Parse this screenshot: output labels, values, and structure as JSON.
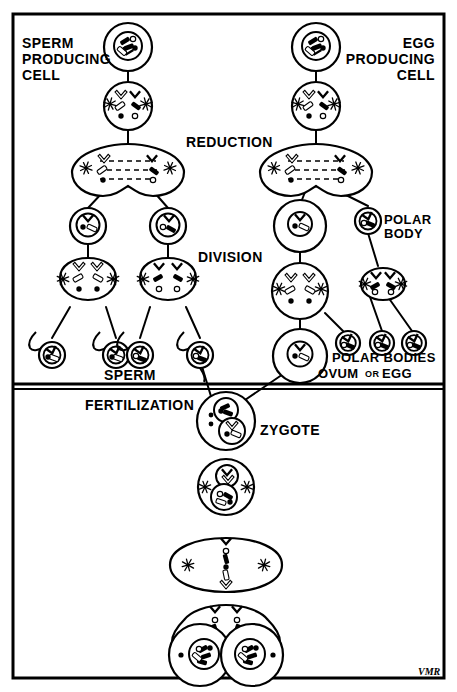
{
  "figure": {
    "title_implied": "Meiosis, Fertilization and Early Cleavage",
    "signature": "VMR",
    "frame_color": "#000000",
    "background_color": "#ffffff",
    "ink_color": "#000000"
  },
  "labels": {
    "sperm_producing_cell": "SPERM\nPRODUCING\nCELL",
    "sperm_producing_cell_lines": [
      "SPERM",
      "PRODUCING",
      "CELL"
    ],
    "egg_producing_cell_lines": [
      "EGG",
      "PRODUCING",
      "CELL"
    ],
    "reduction": "REDUCTION",
    "division": "DIVISION",
    "polar_body_lines": [
      "POLAR",
      "BODY"
    ],
    "polar_bodies": "POLAR BODIES",
    "ovum_or_egg_main": "OVUM",
    "ovum_or_egg_conj": "OR",
    "ovum_or_egg_tail": "EGG",
    "sperm": "SPERM",
    "fertilization": "FERTILIZATION",
    "zygote": "ZYGOTE"
  },
  "panels": [
    {
      "name": "meiosis-panel",
      "order": 1
    },
    {
      "name": "fertilization-cleavage-panel",
      "order": 2
    }
  ],
  "spermatogenesis": {
    "stages": [
      {
        "name": "sperm-producing-cell",
        "cells": 1,
        "label": "SPERM PRODUCING CELL"
      },
      {
        "name": "prophase-cell",
        "cells": 1
      },
      {
        "name": "reduction-division-cell",
        "cells": 1,
        "label": "REDUCTION"
      },
      {
        "name": "secondary-spermatocytes",
        "cells": 2
      },
      {
        "name": "second-division-cells",
        "cells": 2,
        "label": "DIVISION"
      },
      {
        "name": "sperm-cells",
        "cells": 4,
        "label": "SPERM"
      }
    ]
  },
  "oogenesis": {
    "stages": [
      {
        "name": "egg-producing-cell",
        "cells": 1,
        "label": "EGG PRODUCING CELL"
      },
      {
        "name": "prophase-cell",
        "cells": 1
      },
      {
        "name": "reduction-division-cell",
        "cells": 1,
        "label": "REDUCTION"
      },
      {
        "name": "secondary-oocyte-and-polar-body",
        "cells": 2,
        "label": "POLAR BODY"
      },
      {
        "name": "second-division-cells",
        "cells": 2,
        "label": "DIVISION"
      },
      {
        "name": "ovum-and-polar-bodies",
        "cells": 4,
        "labels": [
          "OVUM OR EGG",
          "POLAR BODIES"
        ]
      }
    ]
  },
  "fertilization_sequence": {
    "stages": [
      {
        "name": "zygote",
        "cells": 1,
        "label": "ZYGOTE"
      },
      {
        "name": "fused-nuclei-cell",
        "cells": 1
      },
      {
        "name": "metaphase-cell",
        "cells": 1
      },
      {
        "name": "anaphase-telophase-cell",
        "cells": 2
      },
      {
        "name": "two-cell-stage",
        "cells": 2
      }
    ]
  }
}
